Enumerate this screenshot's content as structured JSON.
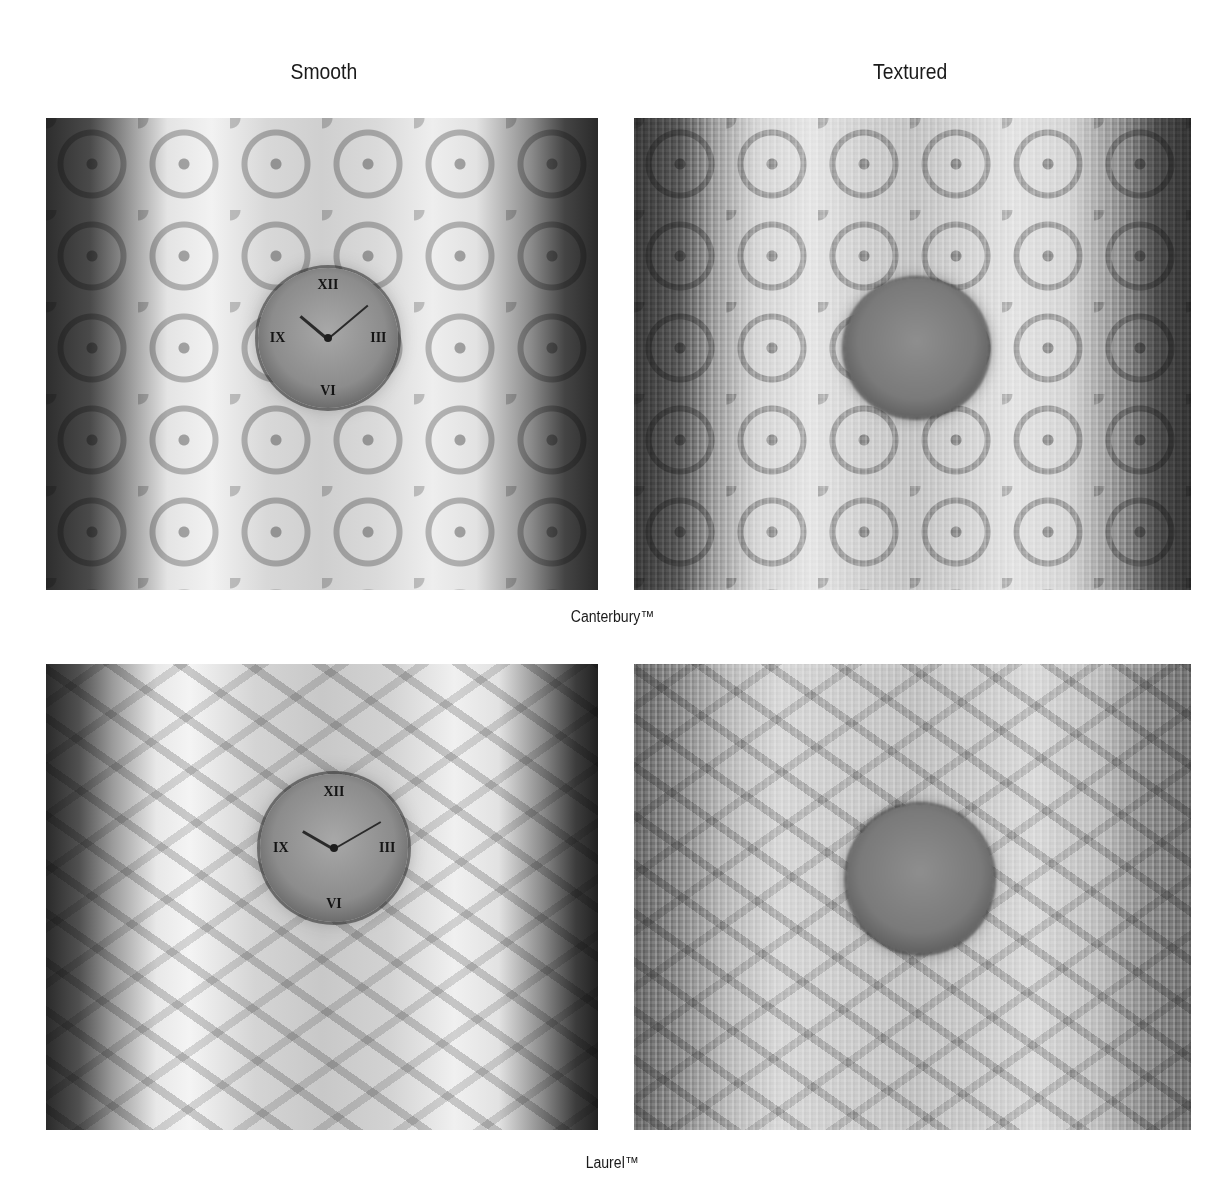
{
  "page": {
    "columns": [
      {
        "label": "Smooth"
      },
      {
        "label": "Textured"
      }
    ],
    "rows": [
      {
        "caption": "Canterbury™",
        "panels": [
          {
            "finish": "Smooth",
            "pattern": "Canterbury",
            "subject": "wall clock behind glass",
            "icon": "clock-icon"
          },
          {
            "finish": "Textured",
            "pattern": "Canterbury",
            "subject": "wall clock behind glass",
            "icon": "clock-icon"
          }
        ]
      },
      {
        "caption": "Laurel™",
        "panels": [
          {
            "finish": "Smooth",
            "pattern": "Laurel",
            "subject": "wall clock behind glass",
            "icon": "clock-icon"
          },
          {
            "finish": "Textured",
            "pattern": "Laurel",
            "subject": "wall clock behind glass",
            "icon": "clock-icon"
          }
        ]
      }
    ],
    "clock_numerals": [
      "XII",
      "I",
      "II",
      "III",
      "IIII",
      "V",
      "VI",
      "VII",
      "VIII",
      "IX",
      "X",
      "XI"
    ]
  }
}
